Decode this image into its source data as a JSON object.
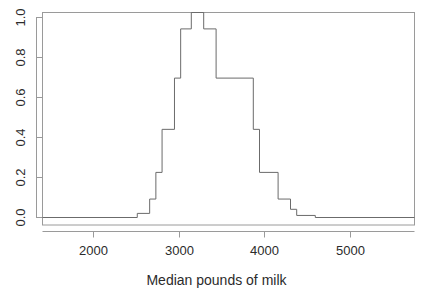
{
  "chart_data": {
    "type": "area",
    "render_style": "step-histogram-outline",
    "title": "",
    "subtitle": "",
    "xlabel": "Median pounds of milk",
    "ylabel": "",
    "xlim": [
      1550,
      5750
    ],
    "ylim": [
      0.0,
      1.0
    ],
    "grid": false,
    "legend": null,
    "x_ticks": [
      2000,
      3000,
      4000,
      5000
    ],
    "x_tick_labels": [
      "2000",
      "3000",
      "4000",
      "5000"
    ],
    "y_ticks": [
      0.0,
      0.2,
      0.4,
      0.6,
      0.8,
      1.0
    ],
    "y_tick_labels": [
      "0.0",
      "0.2",
      "0.4",
      "0.6",
      "0.8",
      "1.0"
    ],
    "bin_width": 140,
    "bin_edges": [
      1550,
      1690,
      1830,
      1970,
      2110,
      2250,
      2390,
      2530,
      2620,
      2760,
      2900,
      3040,
      3180,
      3230,
      3370,
      3510,
      3650,
      3790,
      3930,
      4070,
      4210,
      4350,
      4490,
      4630,
      4770,
      4910,
      5050,
      5190,
      5330,
      5470,
      5610,
      5750
    ],
    "step_points": [
      {
        "x": 1550,
        "y": 0.0
      },
      {
        "x": 2620,
        "y": 0.0
      },
      {
        "x": 2620,
        "y": 0.02
      },
      {
        "x": 2760,
        "y": 0.02
      },
      {
        "x": 2760,
        "y": 0.09
      },
      {
        "x": 2830,
        "y": 0.09
      },
      {
        "x": 2830,
        "y": 0.22
      },
      {
        "x": 2900,
        "y": 0.22
      },
      {
        "x": 2900,
        "y": 0.43
      },
      {
        "x": 3040,
        "y": 0.43
      },
      {
        "x": 3040,
        "y": 0.68
      },
      {
        "x": 3110,
        "y": 0.68
      },
      {
        "x": 3110,
        "y": 0.92
      },
      {
        "x": 3230,
        "y": 0.92
      },
      {
        "x": 3230,
        "y": 1.0
      },
      {
        "x": 3370,
        "y": 1.0
      },
      {
        "x": 3370,
        "y": 0.92
      },
      {
        "x": 3510,
        "y": 0.92
      },
      {
        "x": 3510,
        "y": 0.68
      },
      {
        "x": 3930,
        "y": 0.68
      },
      {
        "x": 3930,
        "y": 0.43
      },
      {
        "x": 4000,
        "y": 0.43
      },
      {
        "x": 4000,
        "y": 0.22
      },
      {
        "x": 4210,
        "y": 0.22
      },
      {
        "x": 4210,
        "y": 0.09
      },
      {
        "x": 4350,
        "y": 0.09
      },
      {
        "x": 4350,
        "y": 0.04
      },
      {
        "x": 4420,
        "y": 0.04
      },
      {
        "x": 4420,
        "y": 0.01
      },
      {
        "x": 4630,
        "y": 0.01
      },
      {
        "x": 4630,
        "y": 0.0
      },
      {
        "x": 5750,
        "y": 0.0
      }
    ],
    "bar_values": [
      {
        "x_center": 2690,
        "value": 0.02
      },
      {
        "x_center": 2795,
        "value": 0.09
      },
      {
        "x_center": 2865,
        "value": 0.22
      },
      {
        "x_center": 2970,
        "value": 0.43
      },
      {
        "x_center": 3075,
        "value": 0.68
      },
      {
        "x_center": 3170,
        "value": 0.92
      },
      {
        "x_center": 3300,
        "value": 1.0
      },
      {
        "x_center": 3440,
        "value": 0.92
      },
      {
        "x_center": 3720,
        "value": 0.68
      },
      {
        "x_center": 3965,
        "value": 0.43
      },
      {
        "x_center": 4105,
        "value": 0.22
      },
      {
        "x_center": 4280,
        "value": 0.09
      },
      {
        "x_center": 4385,
        "value": 0.04
      },
      {
        "x_center": 4525,
        "value": 0.01
      }
    ],
    "line_color": "#6b6b6b",
    "axis_color": "#9a9a9a",
    "background_color": "#ffffff"
  },
  "axes": {
    "x_title": "Median pounds of milk",
    "x_tick_labels": [
      "2000",
      "3000",
      "4000",
      "5000"
    ],
    "y_tick_labels": [
      "0.0",
      "0.2",
      "0.4",
      "0.6",
      "0.8",
      "1.0"
    ]
  }
}
